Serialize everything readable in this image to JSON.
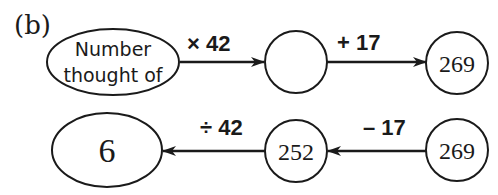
{
  "part_label": "(b)",
  "forward_flow": {
    "start": {
      "text_line1": "Number",
      "text_line2": "thought of"
    },
    "step1": {
      "operation": "× 42"
    },
    "middle": {
      "value": ""
    },
    "step2": {
      "operation": "+ 17"
    },
    "end": {
      "value": "269"
    }
  },
  "reverse_flow": {
    "start": {
      "value": "269"
    },
    "step1": {
      "operation": "– 17"
    },
    "middle": {
      "value": "252"
    },
    "step2": {
      "operation": "÷ 42"
    },
    "end": {
      "value": "6"
    }
  },
  "colors": {
    "stroke": "#1a1a1a",
    "background": "#ffffff"
  }
}
